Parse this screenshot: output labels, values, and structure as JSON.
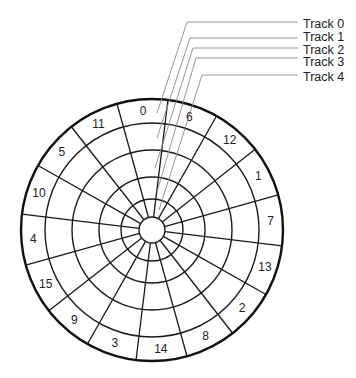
{
  "diagram": {
    "center": [
      152,
      230
    ],
    "ring_radii": [
      13,
      31,
      53,
      80,
      107
    ],
    "outer_radius": 131,
    "spoke_start_angle_deg": 7,
    "sector_count": 16,
    "sector_label_radius": 119,
    "sector_labels_clockwise_from_top": [
      "0",
      "6",
      "12",
      "1",
      "7",
      "13",
      "2",
      "8",
      "14",
      "3",
      "9",
      "15",
      "4",
      "10",
      "5",
      "11"
    ],
    "first_sector_start_angle_deg": -15.5,
    "tracks": [
      {
        "label": "Track 0",
        "label_y": 24,
        "line_y": 22,
        "corner_x": 187,
        "end": [
          157,
          113
        ]
      },
      {
        "label": "Track 1",
        "label_y": 37,
        "line_y": 38,
        "corner_x": 190,
        "end": [
          157,
          138
        ]
      },
      {
        "label": "Track 2",
        "label_y": 50,
        "line_y": 48,
        "corner_x": 193,
        "end": [
          155,
          168
        ]
      },
      {
        "label": "Track 3",
        "label_y": 62,
        "line_y": 58,
        "corner_x": 196,
        "end": [
          157,
          192
        ]
      },
      {
        "label": "Track 4",
        "label_y": 77,
        "line_y": 75,
        "corner_x": 202,
        "end": [
          159,
          210
        ]
      }
    ],
    "leader_line_end_x": 298,
    "track_label_x": 303,
    "colors": {
      "lines": "#1a1a1a",
      "leaders": "#8a8a8a",
      "text": "#222222",
      "background": "#ffffff"
    }
  }
}
